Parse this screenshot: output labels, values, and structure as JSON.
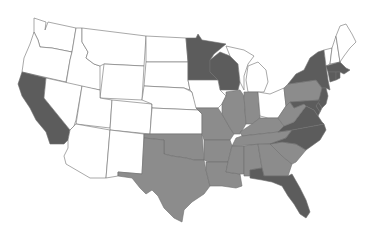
{
  "map": {
    "type": "choropleth",
    "region": "United States (contiguous)",
    "legend": [],
    "colors": {
      "none": "#ffffff",
      "mid": "#8c8c8c",
      "dark": "#5c5c5c",
      "border": "#6e6e6e"
    },
    "states": {
      "dark": [
        "CA",
        "MN",
        "WI",
        "NY",
        "NJ",
        "MA",
        "CT",
        "RI",
        "MD",
        "DE",
        "VA",
        "NC",
        "FL"
      ],
      "mid": [
        "TX",
        "OK",
        "AR",
        "LA",
        "MO",
        "IL",
        "IN",
        "KY",
        "TN",
        "MS",
        "AL",
        "GA",
        "SC",
        "WV",
        "PA"
      ],
      "none": [
        "WA",
        "OR",
        "ID",
        "MT",
        "WY",
        "NV",
        "UT",
        "CO",
        "AZ",
        "NM",
        "ND",
        "SD",
        "NE",
        "KS",
        "IA",
        "MI",
        "OH",
        "ME",
        "NH",
        "VT"
      ]
    }
  }
}
